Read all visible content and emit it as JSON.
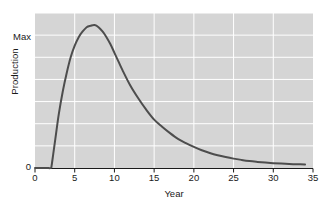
{
  "chart_data": {
    "type": "line",
    "title": "",
    "subtitle": "",
    "xlabel": "Year",
    "ylabel": "Production",
    "xlim": [
      0,
      35
    ],
    "ylim": [
      0,
      1.09
    ],
    "xticks": [
      0,
      5,
      10,
      15,
      20,
      25,
      30,
      35
    ],
    "xtick_labels": [
      "0",
      "5",
      "10",
      "15",
      "20",
      "25",
      "30",
      "35"
    ],
    "ytick_labels": [
      "0",
      "Max"
    ],
    "ytick_values": [
      0,
      1.0
    ],
    "grid": true,
    "grid_color": "#ffffff",
    "plot_background": "#d5d5d5",
    "legend": null,
    "legend_position": "none",
    "annotations": [],
    "series": [
      {
        "name": "Production",
        "color": "#4d4d4d",
        "line_width": 2.0,
        "x": [
          0,
          0.5,
          1.0,
          1.5,
          2.0,
          2.1,
          2.3,
          2.6,
          3.0,
          3.5,
          4.0,
          4.5,
          5.0,
          5.5,
          6.0,
          6.5,
          7.0,
          7.5,
          8.0,
          8.5,
          9.0,
          9.5,
          10.0,
          10.5,
          11.0,
          12.0,
          13.0,
          14.0,
          15.0,
          16.0,
          17.0,
          18.0,
          19.0,
          20.0,
          21.0,
          22.0,
          23.0,
          24.0,
          25.0,
          26.0,
          27.0,
          28.0,
          29.0,
          30.0,
          31.0,
          32.0,
          33.0,
          34.0
        ],
        "y": [
          0.0,
          0.0,
          0.0,
          0.0,
          0.0,
          0.02,
          0.1,
          0.22,
          0.38,
          0.54,
          0.67,
          0.78,
          0.86,
          0.92,
          0.96,
          0.99,
          1.0,
          1.005,
          0.99,
          0.96,
          0.92,
          0.87,
          0.81,
          0.75,
          0.69,
          0.58,
          0.49,
          0.41,
          0.34,
          0.29,
          0.245,
          0.205,
          0.175,
          0.148,
          0.125,
          0.106,
          0.09,
          0.077,
          0.066,
          0.057,
          0.049,
          0.043,
          0.038,
          0.034,
          0.031,
          0.028,
          0.026,
          0.025
        ]
      }
    ]
  },
  "axes": {
    "y_label": "Production",
    "y_tick_max": "Max",
    "y_tick_zero": "0",
    "x_label": "Year",
    "x_ticks": [
      "0",
      "5",
      "10",
      "15",
      "20",
      "25",
      "30",
      "35"
    ]
  }
}
